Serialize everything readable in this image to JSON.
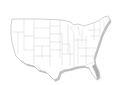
{
  "map": {
    "subject": "United States",
    "style": "blank state outline map with drop shadow",
    "colors": {
      "land": "#ffffff",
      "state_border": "#cfcfcf",
      "outline": "#bdbdbd",
      "shadow": "#8a8a8a"
    }
  }
}
